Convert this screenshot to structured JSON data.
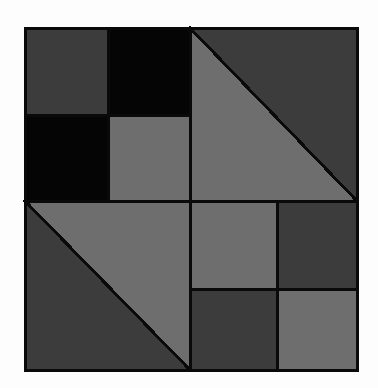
{
  "artwork": {
    "title": "Geometric Quilt Block",
    "canvas": {
      "width": 378,
      "height": 388,
      "background_color": "#fdfdfd"
    },
    "block": {
      "x": 25,
      "y": 28,
      "width": 332,
      "height": 342,
      "outline_color": "#0a0a0a",
      "outline_width": 3
    },
    "palette": {
      "black": "#050505",
      "dark_gray": "#3c3c3c",
      "light_gray": "#6e6e6e",
      "outline": "#0a0a0a",
      "background": "#fdfdfd"
    },
    "grid": {
      "columns": 2,
      "rows": 2,
      "center_x": 190,
      "center_y": 201
    },
    "quadrants": [
      {
        "name": "top-left",
        "type": "checkerboard",
        "x": 25,
        "y": 28,
        "width": 165,
        "height": 173,
        "sub_center_x": 108,
        "sub_center_y": 115,
        "cells": [
          {
            "position": "top-left",
            "color": "#3c3c3c",
            "label": "dark gray square"
          },
          {
            "position": "top-right",
            "color": "#050505",
            "label": "black square"
          },
          {
            "position": "bottom-left",
            "color": "#050505",
            "label": "black square"
          },
          {
            "position": "bottom-right",
            "color": "#6e6e6e",
            "label": "light gray square"
          }
        ]
      },
      {
        "name": "top-right",
        "type": "half-square-triangle",
        "x": 190,
        "y": 28,
        "width": 167,
        "height": 173,
        "diagonal": "top-left-to-bottom-right",
        "cells": [
          {
            "position": "lower-left",
            "color": "#6e6e6e",
            "label": "light gray triangle"
          },
          {
            "position": "upper-right",
            "color": "#3c3c3c",
            "label": "dark gray triangle"
          }
        ]
      },
      {
        "name": "bottom-left",
        "type": "half-square-triangle",
        "x": 25,
        "y": 201,
        "width": 165,
        "height": 169,
        "diagonal": "top-left-to-bottom-right",
        "cells": [
          {
            "position": "upper-right",
            "color": "#6e6e6e",
            "label": "light gray triangle"
          },
          {
            "position": "lower-left",
            "color": "#3c3c3c",
            "label": "dark gray triangle"
          }
        ]
      },
      {
        "name": "bottom-right",
        "type": "checkerboard",
        "x": 190,
        "y": 201,
        "width": 167,
        "height": 169,
        "sub_center_x": 277,
        "sub_center_y": 289,
        "cells": [
          {
            "position": "top-left",
            "color": "#6e6e6e",
            "label": "light gray square"
          },
          {
            "position": "top-right",
            "color": "#3c3c3c",
            "label": "dark gray square"
          },
          {
            "position": "bottom-left",
            "color": "#3c3c3c",
            "label": "dark gray square"
          },
          {
            "position": "bottom-right",
            "color": "#6e6e6e",
            "label": "light gray square"
          }
        ]
      }
    ]
  }
}
